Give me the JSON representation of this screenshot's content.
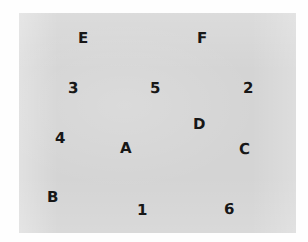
{
  "figure": {
    "type": "scatter-label-map",
    "background_color": "#fefefe",
    "panel_color": "#d4d4d4",
    "label_color": "#171717",
    "panel": {
      "x": 19,
      "y": 13,
      "width": 277,
      "height": 220
    }
  },
  "labels": [
    {
      "text": "E",
      "x": 78,
      "y": 31,
      "size": 15,
      "kind": "letter"
    },
    {
      "text": "F",
      "x": 197,
      "y": 31,
      "size": 15,
      "kind": "letter"
    },
    {
      "text": "3",
      "x": 68,
      "y": 81,
      "size": 15,
      "kind": "digit"
    },
    {
      "text": "5",
      "x": 150,
      "y": 81,
      "size": 15,
      "kind": "digit"
    },
    {
      "text": "2",
      "x": 243,
      "y": 81,
      "size": 15,
      "kind": "digit"
    },
    {
      "text": "D",
      "x": 193,
      "y": 117,
      "size": 15,
      "kind": "letter"
    },
    {
      "text": "4",
      "x": 55,
      "y": 131,
      "size": 15,
      "kind": "digit"
    },
    {
      "text": "A",
      "x": 120,
      "y": 141,
      "size": 15,
      "kind": "letter"
    },
    {
      "text": "C",
      "x": 239,
      "y": 142,
      "size": 15,
      "kind": "letter"
    },
    {
      "text": "B",
      "x": 47,
      "y": 190,
      "size": 15,
      "kind": "letter"
    },
    {
      "text": "1",
      "x": 137,
      "y": 203,
      "size": 15,
      "kind": "digit"
    },
    {
      "text": "6",
      "x": 224,
      "y": 202,
      "size": 15,
      "kind": "digit"
    }
  ]
}
